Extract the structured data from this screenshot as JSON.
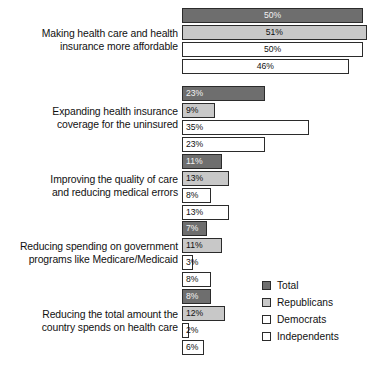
{
  "chart_data": {
    "type": "bar",
    "orientation": "horizontal",
    "title": "",
    "subtitle": "",
    "xlabel": "",
    "ylabel": "",
    "xlim": [
      0,
      55
    ],
    "grid": false,
    "value_suffix": "%",
    "legend_position": "bottom-right",
    "categories": [
      "Making health care and health\ninsurance more affordable",
      "Expanding health insurance\ncoverage for the uninsured",
      "Improving the quality of care\nand reducing medical errors",
      "Reducing spending on government\nprograms like Medicare/Medicaid",
      "Reducing the total amount the\ncountry spends on health care"
    ],
    "series": [
      {
        "name": "Total",
        "color": "#6e6e6e",
        "values": [
          50,
          23,
          11,
          7,
          8
        ],
        "labels": [
          "50%",
          "23%",
          "11%",
          "7%",
          "8%"
        ]
      },
      {
        "name": "Republicans",
        "color": "#c8c8c8",
        "values": [
          51,
          9,
          13,
          11,
          12
        ],
        "labels": [
          "51%",
          "9%",
          "13%",
          "11%",
          "12%"
        ]
      },
      {
        "name": "Democrats",
        "color": "#ffffff",
        "values": [
          50,
          35,
          8,
          3,
          2
        ],
        "labels": [
          "50%",
          "35%",
          "8%",
          "3%",
          "2%"
        ]
      },
      {
        "name": "Independents",
        "color": "#ffffff",
        "values": [
          46,
          23,
          13,
          8,
          6
        ],
        "labels": [
          "46%",
          "23%",
          "13%",
          "8%",
          "6%"
        ]
      }
    ]
  },
  "legend": {
    "items": [
      {
        "label": "Total",
        "color": "#6e6e6e"
      },
      {
        "label": "Republicans",
        "color": "#c8c8c8"
      },
      {
        "label": "Democrats",
        "color": "#ffffff"
      },
      {
        "label": "Independents",
        "color": "#ffffff"
      }
    ]
  }
}
